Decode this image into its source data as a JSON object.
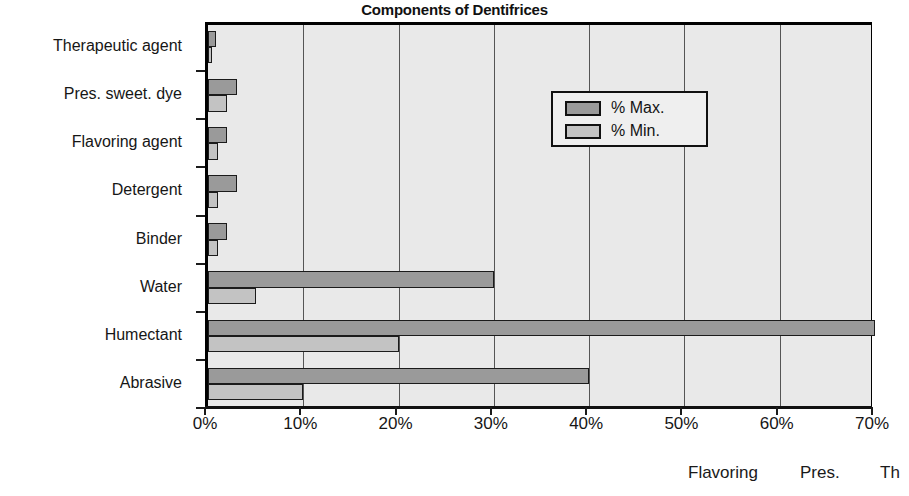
{
  "chart_data": {
    "type": "bar",
    "orientation": "horizontal",
    "title": "Components of Dentifrices",
    "xlabel": "",
    "ylabel": "",
    "xlim": [
      0,
      70
    ],
    "xtick_labels": [
      "0%",
      "10%",
      "20%",
      "30%",
      "40%",
      "50%",
      "60%",
      "70%"
    ],
    "xtick_values": [
      0,
      10,
      20,
      30,
      40,
      50,
      60,
      70
    ],
    "grid": true,
    "legend_position": "upper right inside",
    "categories": [
      "Therapeutic agent",
      "Pres. sweet. dye",
      "Flavoring agent",
      "Detergent",
      "Binder",
      "Water",
      "Humectant",
      "Abrasive"
    ],
    "series": [
      {
        "name": "% Max.",
        "color": "#9a9a9a",
        "values": [
          0.8,
          3,
          2,
          3,
          2,
          30,
          70,
          40
        ]
      },
      {
        "name": "% Min.",
        "color": "#c3c3c3",
        "values": [
          0.2,
          2,
          1,
          1,
          1,
          5,
          20,
          10
        ]
      }
    ]
  },
  "legend": {
    "items": [
      {
        "label": "% Max.",
        "color": "#9a9a9a"
      },
      {
        "label": "% Min.",
        "color": "#c3c3c3"
      }
    ]
  },
  "bottom_fragments": [
    {
      "text": "Flavoring",
      "left": 688
    },
    {
      "text": "Pres.",
      "left": 800
    },
    {
      "text": "Th",
      "left": 880
    }
  ],
  "colors": {
    "plot_background": "#e9e9e9",
    "axis": "#111111",
    "gridline": "#555555",
    "max_bar": "#9a9a9a",
    "min_bar": "#c3c3c3"
  }
}
